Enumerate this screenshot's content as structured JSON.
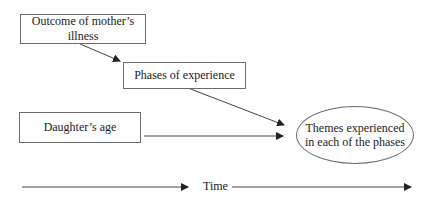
{
  "diagram": {
    "nodes": {
      "outcome": {
        "label": "Outcome of mother’s illness"
      },
      "phases": {
        "label": "Phases of experience"
      },
      "age": {
        "label": "Daughter’s age"
      },
      "themes": {
        "line1": "Themes experienced",
        "line2": "in each of the phases"
      }
    },
    "edges": [
      {
        "from": "outcome",
        "to": "phases"
      },
      {
        "from": "phases",
        "to": "themes"
      },
      {
        "from": "age",
        "to": "themes"
      }
    ],
    "timeline": {
      "label": "Time"
    },
    "colors": {
      "stroke": "#333333",
      "border": "#6b6b6b",
      "text": "#222222"
    }
  }
}
